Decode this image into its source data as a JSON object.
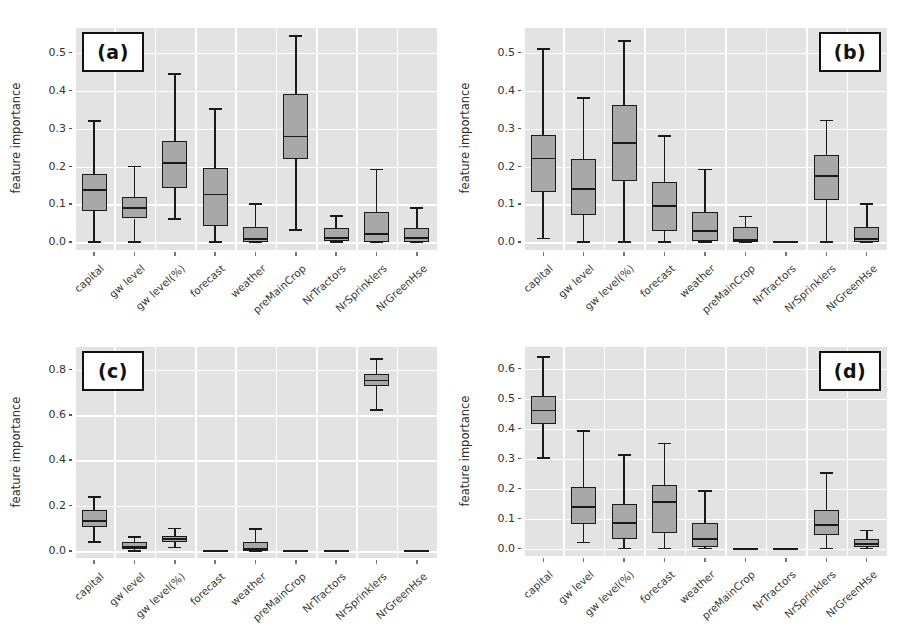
{
  "figure": {
    "width": 900,
    "height": 644,
    "background": "#ffffff",
    "plot_background": "#e3e3e3",
    "grid_color": "#ffffff",
    "box_fill": "#a8a8a8",
    "box_edge": "#1a1a1a"
  },
  "categories": [
    "capital",
    "gw level",
    "gw level(%)",
    "forecast",
    "weather",
    "preMainCrop",
    "NrTractors",
    "NrSprinklers",
    "NrGreenHse"
  ],
  "ylabel": "feature importance",
  "panels": [
    {
      "tag": "(a)",
      "tag_pos": "left"
    },
    {
      "tag": "(b)",
      "tag_pos": "right"
    },
    {
      "tag": "(c)",
      "tag_pos": "left"
    },
    {
      "tag": "(d)",
      "tag_pos": "right"
    }
  ],
  "chart_data": [
    {
      "type": "box",
      "panel": "(a)",
      "title": "",
      "xlabel": "",
      "ylabel": "feature importance",
      "ylim": [
        -0.02,
        0.565
      ],
      "yticks": [
        0.0,
        0.1,
        0.2,
        0.3,
        0.4,
        0.5
      ],
      "ytick_labels": [
        "0.0",
        "0.1",
        "0.2",
        "0.3",
        "0.4",
        "0.5"
      ],
      "grid": true,
      "categories": [
        "capital",
        "gw level",
        "gw level(%)",
        "forecast",
        "weather",
        "preMainCrop",
        "NrTractors",
        "NrSprinklers",
        "NrGreenHse"
      ],
      "boxes": [
        {
          "label": "capital",
          "whisker_low": 0.0,
          "q1": 0.082,
          "median": 0.137,
          "q3": 0.18,
          "whisker_high": 0.32
        },
        {
          "label": "gw level",
          "whisker_low": 0.0,
          "q1": 0.063,
          "median": 0.09,
          "q3": 0.12,
          "whisker_high": 0.2
        },
        {
          "label": "gw level(%)",
          "whisker_low": 0.062,
          "q1": 0.143,
          "median": 0.21,
          "q3": 0.268,
          "whisker_high": 0.443
        },
        {
          "label": "forecast",
          "whisker_low": 0.0,
          "q1": 0.043,
          "median": 0.126,
          "q3": 0.197,
          "whisker_high": 0.352
        },
        {
          "label": "weather",
          "whisker_low": 0.0,
          "q1": 0.002,
          "median": 0.008,
          "q3": 0.04,
          "whisker_high": 0.101
        },
        {
          "label": "preMainCrop",
          "whisker_low": 0.033,
          "q1": 0.221,
          "median": 0.279,
          "q3": 0.391,
          "whisker_high": 0.543
        },
        {
          "label": "NrTractors",
          "whisker_low": 0.0,
          "q1": 0.003,
          "median": 0.012,
          "q3": 0.039,
          "whisker_high": 0.069
        },
        {
          "label": "NrSprinklers",
          "whisker_low": 0.0,
          "q1": 0.0,
          "median": 0.021,
          "q3": 0.081,
          "whisker_high": 0.192
        },
        {
          "label": "NrGreenHse",
          "whisker_low": 0.0,
          "q1": 0.002,
          "median": 0.011,
          "q3": 0.039,
          "whisker_high": 0.091
        }
      ]
    },
    {
      "type": "box",
      "panel": "(b)",
      "title": "",
      "xlabel": "",
      "ylabel": "feature importance",
      "ylim": [
        -0.02,
        0.565
      ],
      "yticks": [
        0.0,
        0.1,
        0.2,
        0.3,
        0.4,
        0.5
      ],
      "ytick_labels": [
        "0.0",
        "0.1",
        "0.2",
        "0.3",
        "0.4",
        "0.5"
      ],
      "grid": true,
      "categories": [
        "capital",
        "gw level",
        "gw level(%)",
        "forecast",
        "weather",
        "preMainCrop",
        "NrTractors",
        "NrSprinklers",
        "NrGreenHse"
      ],
      "boxes": [
        {
          "label": "capital",
          "whisker_low": 0.01,
          "q1": 0.133,
          "median": 0.221,
          "q3": 0.284,
          "whisker_high": 0.51
        },
        {
          "label": "gw level",
          "whisker_low": 0.0,
          "q1": 0.071,
          "median": 0.14,
          "q3": 0.221,
          "whisker_high": 0.381
        },
        {
          "label": "gw level(%)",
          "whisker_low": 0.0,
          "q1": 0.163,
          "median": 0.261,
          "q3": 0.361,
          "whisker_high": 0.531
        },
        {
          "label": "forecast",
          "whisker_low": 0.0,
          "q1": 0.03,
          "median": 0.096,
          "q3": 0.159,
          "whisker_high": 0.281
        },
        {
          "label": "weather",
          "whisker_low": 0.0,
          "q1": 0.004,
          "median": 0.031,
          "q3": 0.08,
          "whisker_high": 0.192
        },
        {
          "label": "preMainCrop",
          "whisker_low": 0.0,
          "q1": 0.002,
          "median": 0.006,
          "q3": 0.04,
          "whisker_high": 0.068
        },
        {
          "label": "NrTractors",
          "whisker_low": 0.0,
          "q1": 0.0,
          "median": 0.0,
          "q3": 0.0,
          "whisker_high": 0.0
        },
        {
          "label": "NrSprinklers",
          "whisker_low": 0.0,
          "q1": 0.113,
          "median": 0.176,
          "q3": 0.231,
          "whisker_high": 0.321
        },
        {
          "label": "NrGreenHse",
          "whisker_low": 0.0,
          "q1": 0.001,
          "median": 0.008,
          "q3": 0.04,
          "whisker_high": 0.101
        }
      ]
    },
    {
      "type": "box",
      "panel": "(c)",
      "title": "",
      "xlabel": "",
      "ylabel": "feature importance",
      "ylim": [
        -0.03,
        0.9
      ],
      "yticks": [
        0.0,
        0.2,
        0.4,
        0.6,
        0.8
      ],
      "ytick_labels": [
        "0.0",
        "0.2",
        "0.4",
        "0.6",
        "0.8"
      ],
      "grid": true,
      "categories": [
        "capital",
        "gw level",
        "gw level(%)",
        "forecast",
        "weather",
        "preMainCrop",
        "NrTractors",
        "NrSprinklers",
        "NrGreenHse"
      ],
      "boxes": [
        {
          "label": "capital",
          "whisker_low": 0.04,
          "q1": 0.108,
          "median": 0.131,
          "q3": 0.182,
          "whisker_high": 0.237
        },
        {
          "label": "gw level",
          "whisker_low": 0.0,
          "q1": 0.009,
          "median": 0.017,
          "q3": 0.04,
          "whisker_high": 0.061
        },
        {
          "label": "gw level(%)",
          "whisker_low": 0.016,
          "q1": 0.04,
          "median": 0.052,
          "q3": 0.068,
          "whisker_high": 0.1
        },
        {
          "label": "forecast",
          "whisker_low": 0.0,
          "q1": 0.0,
          "median": 0.0,
          "q3": 0.0,
          "whisker_high": 0.0
        },
        {
          "label": "weather",
          "whisker_low": 0.0,
          "q1": 0.002,
          "median": 0.01,
          "q3": 0.04,
          "whisker_high": 0.099
        },
        {
          "label": "preMainCrop",
          "whisker_low": 0.0,
          "q1": 0.0,
          "median": 0.0,
          "q3": 0.0,
          "whisker_high": 0.0
        },
        {
          "label": "NrTractors",
          "whisker_low": 0.0,
          "q1": 0.0,
          "median": 0.0,
          "q3": 0.0,
          "whisker_high": 0.0
        },
        {
          "label": "NrSprinklers",
          "whisker_low": 0.622,
          "q1": 0.727,
          "median": 0.752,
          "q3": 0.779,
          "whisker_high": 0.845
        },
        {
          "label": "NrGreenHse",
          "whisker_low": 0.0,
          "q1": 0.0,
          "median": 0.0,
          "q3": 0.0,
          "whisker_high": 0.0
        }
      ]
    },
    {
      "type": "box",
      "panel": "(d)",
      "title": "",
      "xlabel": "",
      "ylabel": "feature importance",
      "ylim": [
        -0.025,
        0.672
      ],
      "yticks": [
        0.0,
        0.1,
        0.2,
        0.3,
        0.4,
        0.5,
        0.6
      ],
      "ytick_labels": [
        "0.0",
        "0.1",
        "0.2",
        "0.3",
        "0.4",
        "0.5",
        "0.6"
      ],
      "grid": true,
      "categories": [
        "capital",
        "gw level",
        "gw level(%)",
        "forecast",
        "weather",
        "preMainCrop",
        "NrTractors",
        "NrSprinklers",
        "NrGreenHse"
      ],
      "boxes": [
        {
          "label": "capital",
          "whisker_low": 0.301,
          "q1": 0.415,
          "median": 0.46,
          "q3": 0.508,
          "whisker_high": 0.639
        },
        {
          "label": "gw level",
          "whisker_low": 0.02,
          "q1": 0.082,
          "median": 0.137,
          "q3": 0.205,
          "whisker_high": 0.392
        },
        {
          "label": "gw level(%)",
          "whisker_low": 0.0,
          "q1": 0.031,
          "median": 0.086,
          "q3": 0.149,
          "whisker_high": 0.311
        },
        {
          "label": "forecast",
          "whisker_low": 0.0,
          "q1": 0.051,
          "median": 0.155,
          "q3": 0.211,
          "whisker_high": 0.35
        },
        {
          "label": "weather",
          "whisker_low": 0.0,
          "q1": 0.004,
          "median": 0.031,
          "q3": 0.086,
          "whisker_high": 0.192
        },
        {
          "label": "preMainCrop",
          "whisker_low": 0.0,
          "q1": 0.0,
          "median": 0.0,
          "q3": 0.0,
          "whisker_high": 0.0
        },
        {
          "label": "NrTractors",
          "whisker_low": 0.0,
          "q1": 0.0,
          "median": 0.0,
          "q3": 0.0,
          "whisker_high": 0.0
        },
        {
          "label": "NrSprinklers",
          "whisker_low": 0.0,
          "q1": 0.045,
          "median": 0.077,
          "q3": 0.128,
          "whisker_high": 0.251
        },
        {
          "label": "NrGreenHse",
          "whisker_low": 0.0,
          "q1": 0.006,
          "median": 0.015,
          "q3": 0.031,
          "whisker_high": 0.06
        }
      ]
    }
  ]
}
